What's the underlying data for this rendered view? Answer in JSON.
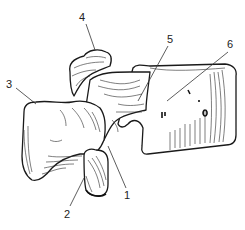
{
  "figure": {
    "labels": [
      {
        "id": "1",
        "text": "1",
        "x": 127,
        "y": 197,
        "target": [
          108,
          146
        ]
      },
      {
        "id": "2",
        "text": "2",
        "x": 66,
        "y": 216,
        "target": [
          84,
          176
        ]
      },
      {
        "id": "3",
        "text": "3",
        "x": 9,
        "y": 88,
        "target": [
          36,
          104
        ]
      },
      {
        "id": "4",
        "text": "4",
        "x": 81,
        "y": 20,
        "target": [
          95,
          50
        ]
      },
      {
        "id": "5",
        "text": "5",
        "x": 168,
        "y": 43,
        "target": [
          138,
          101
        ]
      },
      {
        "id": "6",
        "text": "6",
        "x": 228,
        "y": 48,
        "target": [
          167,
          101
        ]
      }
    ],
    "colors": {
      "ink": "#1a1a1a",
      "background": "#ffffff"
    }
  }
}
